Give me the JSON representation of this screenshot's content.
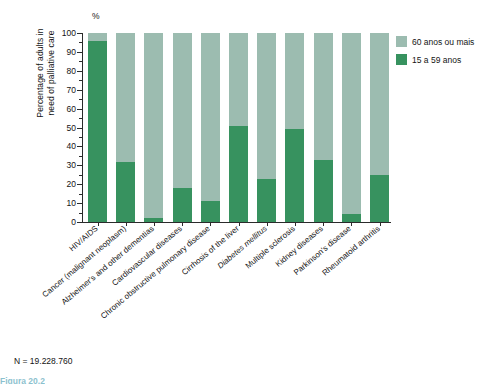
{
  "chart_data": {
    "type": "bar",
    "stacked": true,
    "percent_sign": "%",
    "title": "",
    "xlabel": "",
    "ylabel_line1": "Percentage of adults in",
    "ylabel_line2": "need of palliative care",
    "ylim": [
      0,
      100
    ],
    "ytick_step": 10,
    "yticks": [
      0,
      10,
      20,
      30,
      40,
      50,
      60,
      70,
      80,
      90,
      100
    ],
    "ytick_labels": [
      "0",
      "10",
      "20",
      "30",
      "40",
      "50",
      "60",
      "70",
      "80",
      "90",
      "100"
    ],
    "grid": false,
    "legend_position": "right",
    "categories": [
      "HIV/AIDS",
      "Cancer (malignant neoplasm)",
      "Alzheimer's and other dementias",
      "Cardiovascular diseases",
      "Chronic obstructive pulmonary disease",
      "Cirrhosis of the liver",
      "Diabetes mellitus",
      "Multiple sclerosis",
      "Kidney diseases",
      "Parkinson's disease",
      "Rheumatoid arthritis"
    ],
    "category_italic": [
      false,
      false,
      false,
      false,
      false,
      false,
      true,
      false,
      false,
      false,
      false
    ],
    "series": [
      {
        "name": "15 a 59 anos",
        "color": "#37925f",
        "values": [
          96,
          32,
          2,
          18,
          11,
          51,
          23,
          49,
          33,
          4,
          25
        ]
      },
      {
        "name": "60 anos ou mais",
        "color": "#9cbcb0",
        "values": [
          4,
          68,
          98,
          82,
          89,
          49,
          77,
          51,
          67,
          96,
          75
        ]
      }
    ],
    "annotations": {
      "n_note": "N = 19.228.760",
      "cut_caption": "Figura 20.2"
    }
  },
  "legend": {
    "items": [
      {
        "label": "60 anos ou mais",
        "color": "#9cbcb0"
      },
      {
        "label": "15 a 59 anos",
        "color": "#37925f"
      }
    ]
  }
}
